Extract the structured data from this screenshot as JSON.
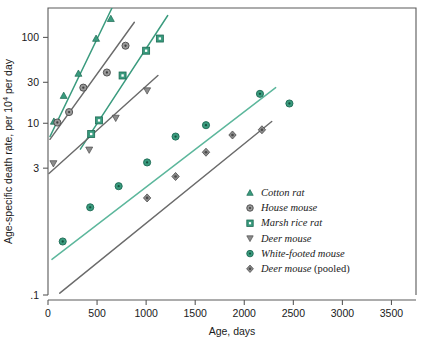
{
  "chart_data": {
    "type": "scatter",
    "title": "",
    "xlabel": "Age, days",
    "ylabel": "Age-specific death rate, per 10⁴ per day",
    "xlim": [
      0,
      3750
    ],
    "ylim_log": [
      0.1,
      220
    ],
    "yscale": "log",
    "xscale": "linear",
    "grid": false,
    "legend_position": "inside-right",
    "xticks": [
      0,
      500,
      1000,
      1500,
      2000,
      2500,
      3000,
      3500
    ],
    "xticklabels": [
      "0",
      "500",
      "1000",
      "1500",
      "2000",
      "2500",
      "3000",
      "3500"
    ],
    "yticks": [
      100,
      30,
      10,
      3,
      0.1
    ],
    "yticklabels": [
      "100",
      "30",
      "10",
      "3",
      ".1"
    ],
    "series": [
      {
        "name": "Cotton rat",
        "marker": "triangle-up",
        "color": "#3a9b7e",
        "line_color": "#3a9b7e",
        "points": [
          {
            "x": 60,
            "y": 10.5
          },
          {
            "x": 160,
            "y": 21.0
          },
          {
            "x": 310,
            "y": 38.0
          },
          {
            "x": 490,
            "y": 97.0
          },
          {
            "x": 640,
            "y": 165.0
          }
        ],
        "fit": {
          "x0": 20,
          "y0": 7.0,
          "x1": 660,
          "y1": 230.0
        }
      },
      {
        "name": "House mouse",
        "marker": "circle",
        "color": "#8c8c8c",
        "line_color": "#6b6b6b",
        "points": [
          {
            "x": 95,
            "y": 10.2
          },
          {
            "x": 215,
            "y": 13.5
          },
          {
            "x": 360,
            "y": 26.0
          },
          {
            "x": 600,
            "y": 39.0
          },
          {
            "x": 790,
            "y": 80.0
          }
        ],
        "fit": {
          "x0": 20,
          "y0": 6.5,
          "x1": 880,
          "y1": 150.0
        }
      },
      {
        "name": "Marsh rice rat",
        "marker": "square",
        "color": "#3a9b7e",
        "line_color": "#3a9b7e",
        "points": [
          {
            "x": 440,
            "y": 7.5
          },
          {
            "x": 520,
            "y": 10.8
          },
          {
            "x": 760,
            "y": 36.0
          },
          {
            "x": 1000,
            "y": 70.0
          },
          {
            "x": 1140,
            "y": 97.0
          }
        ],
        "fit": {
          "x0": 330,
          "y0": 5.0,
          "x1": 1220,
          "y1": 180.0
        }
      },
      {
        "name": "Deer mouse",
        "marker": "triangle-down",
        "color": "#8c8c8c",
        "line_color": "#6b6b6b",
        "points": [
          {
            "x": 55,
            "y": 3.4
          },
          {
            "x": 420,
            "y": 4.9
          },
          {
            "x": 690,
            "y": 11.5
          },
          {
            "x": 1010,
            "y": 24.0
          }
        ],
        "fit": {
          "x0": 10,
          "y0": 2.6,
          "x1": 1120,
          "y1": 36.0
        }
      },
      {
        "name": "White-footed mouse",
        "marker": "circle-dot",
        "color": "#3a9b7e",
        "line_color": "#5cb79c",
        "points": [
          {
            "x": 150,
            "y": 0.42
          },
          {
            "x": 430,
            "y": 1.05
          },
          {
            "x": 720,
            "y": 1.85
          },
          {
            "x": 1010,
            "y": 3.5
          },
          {
            "x": 1300,
            "y": 7.0
          },
          {
            "x": 1610,
            "y": 9.5
          },
          {
            "x": 2160,
            "y": 22.0
          },
          {
            "x": 2460,
            "y": 17.0
          }
        ],
        "fit": {
          "x0": 40,
          "y0": 0.26,
          "x1": 2320,
          "y1": 26.0
        }
      },
      {
        "name": "Deer mouse (pooled)",
        "marker": "diamond",
        "color": "#8c8c8c",
        "line_color": "#6b6b6b",
        "points": [
          {
            "x": 1010,
            "y": 1.35
          },
          {
            "x": 1300,
            "y": 2.4
          },
          {
            "x": 1610,
            "y": 4.6
          },
          {
            "x": 1880,
            "y": 7.3
          },
          {
            "x": 2180,
            "y": 8.4
          }
        ],
        "fit": {
          "x0": 120,
          "y0": 0.105,
          "x1": 2280,
          "y1": 10.5
        }
      }
    ]
  },
  "legend": {
    "items": [
      {
        "label": "Cotton rat",
        "marker": "triangle-up",
        "color": "#3a9b7e"
      },
      {
        "label": "House mouse",
        "marker": "circle",
        "color": "#8c8c8c"
      },
      {
        "label": "Marsh rice rat",
        "marker": "square",
        "color": "#3a9b7e"
      },
      {
        "label": "Deer mouse",
        "marker": "triangle-down",
        "color": "#8c8c8c"
      },
      {
        "label": "White-footed mouse",
        "marker": "circle-dot",
        "color": "#3a9b7e"
      },
      {
        "label": "Deer mouse (pooled)",
        "marker": "diamond",
        "color": "#8c8c8c"
      }
    ]
  }
}
